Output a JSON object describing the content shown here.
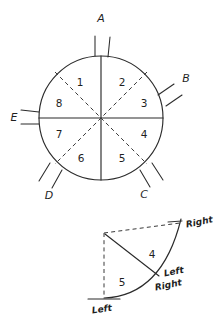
{
  "figure": {
    "ink_color": "#2b2b2b",
    "background_color": "#ffffff"
  },
  "circle_diagram": {
    "name": "eight-sector-circle",
    "center": {
      "x": 101,
      "y": 118
    },
    "radius": 62,
    "solid_axes": [
      "vertical",
      "horizontal"
    ],
    "dashed_axes": [
      "diagonal-45",
      "diagonal-135"
    ],
    "sectors": [
      {
        "id": "1",
        "label": "1",
        "angle_deg": 112.5,
        "label_x": 80,
        "label_y": 83
      },
      {
        "id": "2",
        "label": "2",
        "angle_deg": 67.5,
        "label_x": 122,
        "label_y": 83
      },
      {
        "id": "3",
        "label": "3",
        "angle_deg": 22.5,
        "label_x": 144,
        "label_y": 104
      },
      {
        "id": "4",
        "label": "4",
        "angle_deg": 337.5,
        "label_x": 144,
        "label_y": 135
      },
      {
        "id": "5",
        "label": "5",
        "angle_deg": 292.5,
        "label_x": 122,
        "label_y": 159
      },
      {
        "id": "6",
        "label": "6",
        "angle_deg": 247.5,
        "label_x": 81,
        "label_y": 159
      },
      {
        "id": "7",
        "label": "7",
        "angle_deg": 202.5,
        "label_x": 59,
        "label_y": 135
      },
      {
        "id": "8",
        "label": "8",
        "angle_deg": 157.5,
        "label_x": 59,
        "label_y": 104
      }
    ],
    "perimeter_marks": [
      {
        "id": "A",
        "label": "A",
        "angle_deg": 90,
        "label_x": 101,
        "label_y": 19
      },
      {
        "id": "B",
        "label": "B",
        "angle_deg": 22.5,
        "label_x": 186,
        "label_y": 79
      },
      {
        "id": "C",
        "label": "C",
        "angle_deg": 292.5,
        "label_x": 144,
        "label_y": 195
      },
      {
        "id": "D",
        "label": "D",
        "angle_deg": 247.5,
        "label_x": 49,
        "label_y": 196
      },
      {
        "id": "E",
        "label": "E",
        "angle_deg": 180,
        "label_x": 14,
        "label_y": 118
      }
    ]
  },
  "detail_diagram": {
    "name": "quarter-sector-detail",
    "corner": {
      "x": 104,
      "y": 233
    },
    "arc_start": {
      "x": 104,
      "y": 298
    },
    "arc_end": {
      "x": 182,
      "y": 222
    },
    "dashed_edges": [
      "top",
      "left"
    ],
    "sectors": [
      {
        "id": "4",
        "label": "4",
        "label_x": 152,
        "label_y": 255
      },
      {
        "id": "5",
        "label": "5",
        "label_x": 122,
        "label_y": 283
      }
    ],
    "annotations": [
      {
        "id": "top-right-right",
        "label": "Right",
        "x": 186,
        "y": 225
      },
      {
        "id": "middle-left",
        "label": "Left",
        "x": 164,
        "y": 274
      },
      {
        "id": "middle-right",
        "label": "Right",
        "x": 155,
        "y": 288
      },
      {
        "id": "bottom-left",
        "label": "Left",
        "x": 92,
        "y": 311
      }
    ]
  }
}
